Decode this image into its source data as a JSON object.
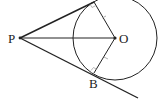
{
  "diagram": {
    "type": "geometry",
    "points": {
      "P": {
        "label": "P",
        "x": 20,
        "y": 38
      },
      "O": {
        "label": "O",
        "x": 115,
        "y": 38
      },
      "A": {
        "label": "",
        "x": 94,
        "y": 2
      },
      "B": {
        "label": "B",
        "x": 94,
        "y": 73
      }
    },
    "circle": {
      "center": "O",
      "radius": 42
    },
    "segments": [
      "PA",
      "PO",
      "PB (extended)",
      "OA",
      "OB"
    ],
    "right_angles": [
      "OAP",
      "OBP"
    ],
    "equal_marks": [
      "OA",
      "OB"
    ],
    "colors": {
      "stroke": "#222222",
      "background": "#ffffff"
    }
  }
}
